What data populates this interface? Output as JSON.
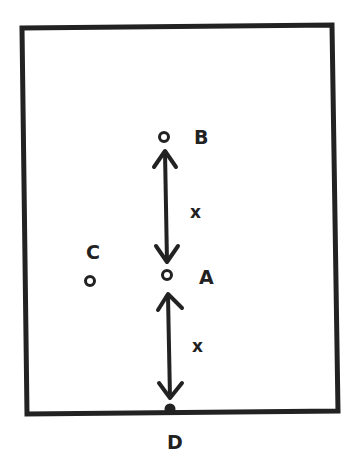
{
  "diagram": {
    "stroke_color": "#222222",
    "background": "#ffffff",
    "points": [
      {
        "id": "B",
        "label": "B"
      },
      {
        "id": "A",
        "label": "A"
      },
      {
        "id": "C",
        "label": "C"
      },
      {
        "id": "D",
        "label": "D"
      }
    ],
    "distances": [
      {
        "from": "A",
        "to": "B",
        "label": "x"
      },
      {
        "from": "A",
        "to": "D",
        "label": "x"
      }
    ]
  }
}
